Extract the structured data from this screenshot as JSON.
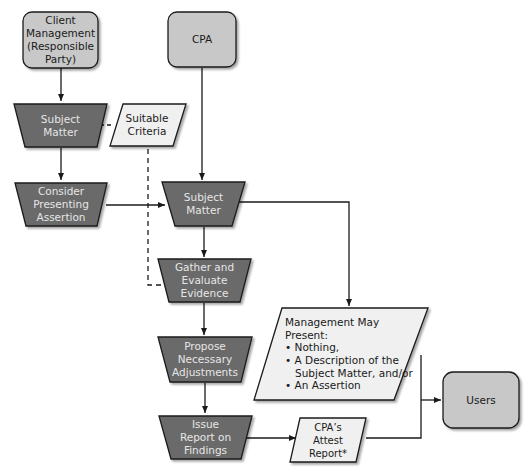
{
  "colors": {
    "rounded_box_fill": "#c8c8c8",
    "process_fill": "#6b6b6b",
    "process_text": "#e6e6e6",
    "parallelogram_fill": "#f0f0f0",
    "stroke": "#1a1a1a",
    "background": "#ffffff"
  },
  "nodes": {
    "client_management": {
      "lines": [
        "Client",
        "Management",
        "(Responsible",
        "Party)"
      ]
    },
    "cpa": {
      "lines": [
        "CPA"
      ]
    },
    "subject_matter_left": {
      "lines": [
        "Subject",
        "Matter"
      ]
    },
    "suitable_criteria": {
      "lines": [
        "Suitable",
        "Criteria"
      ]
    },
    "consider_presenting": {
      "lines": [
        "Consider",
        "Presenting",
        "Assertion"
      ]
    },
    "subject_matter_center": {
      "lines": [
        "Subject",
        "Matter"
      ]
    },
    "gather_evaluate": {
      "lines": [
        "Gather and",
        "Evaluate",
        "Evidence"
      ]
    },
    "propose_adjustments": {
      "lines": [
        "Propose",
        "Necessary",
        "Adjustments"
      ]
    },
    "issue_report": {
      "lines": [
        "Issue",
        "Report on",
        "Findings"
      ]
    },
    "management_may_present": {
      "lines": [
        "Management May",
        "Present:",
        "• Nothing,",
        "• A Description of the",
        "   Subject Matter, and/or",
        "• An Assertion"
      ]
    },
    "cpa_attest_report": {
      "lines": [
        "CPA’s",
        "Attest",
        "Report*"
      ]
    },
    "users": {
      "lines": [
        "Users"
      ]
    }
  }
}
